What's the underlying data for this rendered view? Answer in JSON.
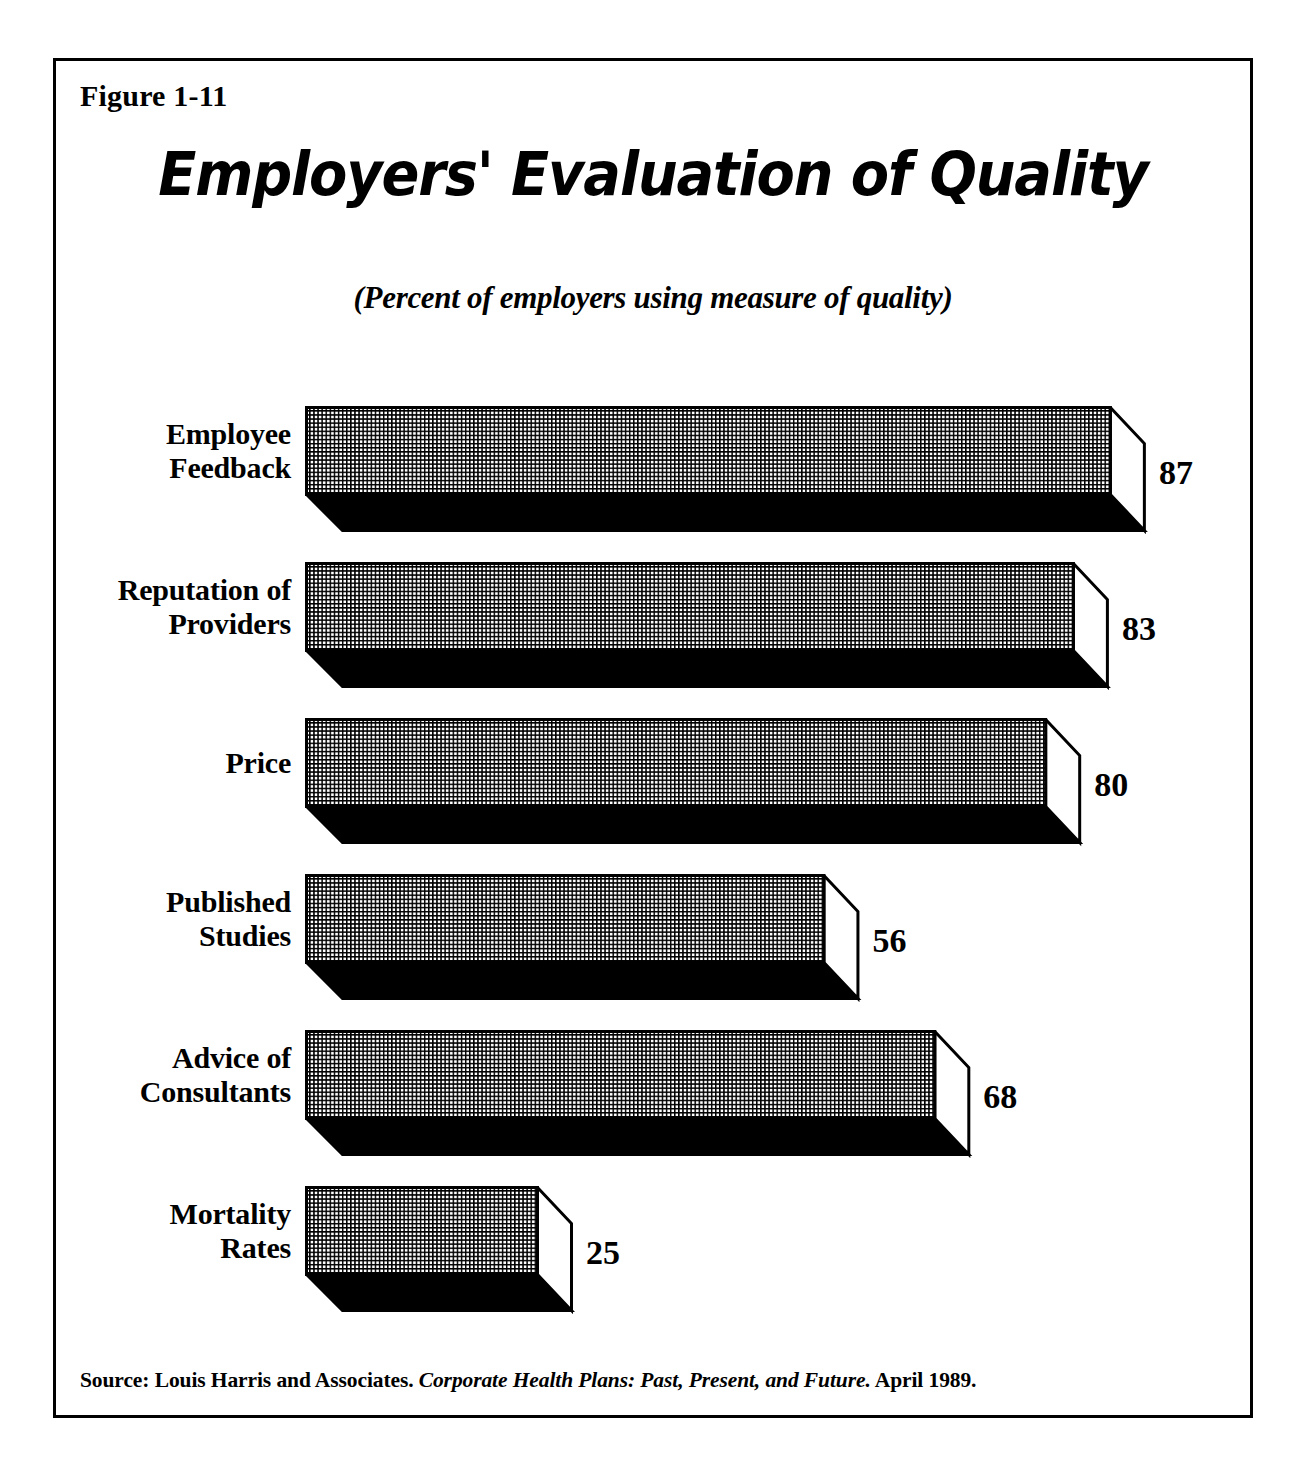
{
  "figure": {
    "label": "Figure 1-11",
    "title": "Employers' Evaluation of Quality",
    "subtitle": "(Percent of employers using measure of quality)"
  },
  "source": {
    "prefix": "Source: Louis Harris and Associates.",
    "publication": "Corporate Health Plans: Past, Present, and Future.",
    "date": "April 1989."
  },
  "colors": {
    "ink": "#000000",
    "paper": "#ffffff",
    "bar_front_fill": "#d8d8d8",
    "bar_side_fill": "#ffffff",
    "bar_bottom_fill": "#000000"
  },
  "chart_data": {
    "type": "bar",
    "orientation": "horizontal",
    "title": "Employers' Evaluation of Quality",
    "subtitle": "(Percent of employers using measure of quality)",
    "xlabel": "",
    "ylabel": "",
    "xlim": [
      0,
      100
    ],
    "grid": false,
    "legend": "none",
    "value_label_position": "outside-end",
    "categories": [
      "Employee Feedback",
      "Reputation of Providers",
      "Price",
      "Published Studies",
      "Advice of Consultants",
      "Mortality Rates"
    ],
    "values": [
      87,
      83,
      80,
      56,
      68,
      25
    ],
    "units": "percent",
    "bars": [
      {
        "category": "Employee Feedback",
        "label_lines": [
          "Employee",
          "Feedback"
        ],
        "value": 87,
        "value_text": "87"
      },
      {
        "category": "Reputation of Providers",
        "label_lines": [
          "Reputation of",
          "Providers"
        ],
        "value": 83,
        "value_text": "83"
      },
      {
        "category": "Price",
        "label_lines": [
          "Price"
        ],
        "value": 80,
        "value_text": "80"
      },
      {
        "category": "Published Studies",
        "label_lines": [
          "Published",
          "Studies"
        ],
        "value": 56,
        "value_text": "56"
      },
      {
        "category": "Advice of Consultants",
        "label_lines": [
          "Advice of",
          "Consultants"
        ],
        "value": 68,
        "value_text": "68"
      },
      {
        "category": "Mortality Rates",
        "label_lines": [
          "Mortality",
          "Rates"
        ],
        "value": 25,
        "value_text": "25"
      }
    ]
  }
}
